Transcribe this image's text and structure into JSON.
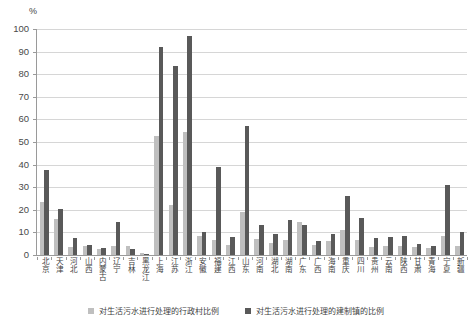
{
  "chart_data": {
    "type": "bar",
    "title": "",
    "xlabel": "",
    "ylabel": "%",
    "unit": "%",
    "ylim": [
      0,
      100
    ],
    "ytick_step": 10,
    "yticks": [
      100,
      90,
      80,
      70,
      60,
      50,
      40,
      30,
      20,
      10,
      0
    ],
    "grid": true,
    "legend_position": "bottom",
    "categories": [
      "北京",
      "天津",
      "河北",
      "山西",
      "内蒙古",
      "辽宁",
      "吉林",
      "黑龙江",
      "上海",
      "江苏",
      "浙江",
      "安徽",
      "福建",
      "江西",
      "山东",
      "河南",
      "湖北",
      "湖南",
      "广东",
      "广西",
      "海南",
      "重庆",
      "四川",
      "贵州",
      "云南",
      "陕西",
      "甘肃",
      "青海",
      "宁夏",
      "新疆"
    ],
    "series": [
      {
        "name": "对生活污水进行处理的行政村比例",
        "color": "#bfbfbf",
        "values": [
          23.5,
          16.0,
          3.5,
          4.2,
          2.5,
          4.0,
          4.2,
          0.8,
          52.5,
          22.0,
          54.5,
          8.5,
          6.5,
          4.5,
          19.0,
          7.0,
          5.5,
          6.5,
          14.5,
          4.5,
          6.0,
          11.0,
          6.5,
          3.5,
          4.0,
          4.0,
          3.5,
          3.0,
          8.5,
          4.0
        ]
      },
      {
        "name": "对生活污水进行处理的建制镇的比例",
        "color": "#595959",
        "values": [
          37.5,
          20.5,
          7.5,
          4.5,
          3.0,
          14.5,
          2.5,
          0.5,
          92.0,
          83.5,
          97.0,
          10.0,
          39.0,
          8.0,
          57.0,
          13.5,
          9.5,
          15.5,
          13.5,
          6.0,
          9.5,
          26.0,
          16.5,
          7.5,
          8.0,
          8.5,
          5.0,
          4.0,
          31.0,
          10.0
        ]
      }
    ]
  },
  "legend": {
    "series1_label": "对生活污水进行处理的行政村比例",
    "series2_label": "对生活污水进行处理的建制镇的比例"
  },
  "axis": {
    "unit_label": "%"
  }
}
